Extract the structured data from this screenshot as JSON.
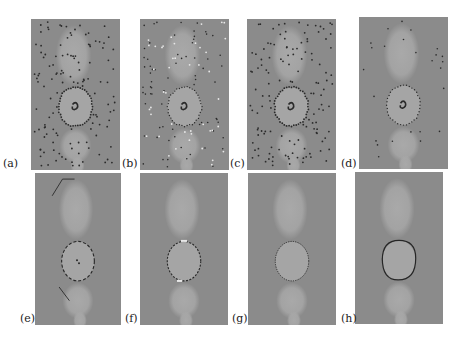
{
  "figure": {
    "panels": [
      {
        "id": "a",
        "label": "(a)",
        "style": "dense-dark-dots",
        "x": 31,
        "y": 19,
        "w": 89,
        "h": 151,
        "label_x": 3,
        "label_y": 158
      },
      {
        "id": "b",
        "label": "(b)",
        "style": "dense-mixed-dots",
        "x": 140,
        "y": 19,
        "w": 89,
        "h": 151,
        "label_x": 122,
        "label_y": 158
      },
      {
        "id": "c",
        "label": "(c)",
        "style": "dense-dark-dots",
        "x": 247,
        "y": 19,
        "w": 89,
        "h": 151,
        "label_x": 230,
        "label_y": 158
      },
      {
        "id": "d",
        "label": "(d)",
        "style": "sparse-dots",
        "x": 359,
        "y": 17,
        "w": 89,
        "h": 152,
        "label_x": 341,
        "label_y": 158
      },
      {
        "id": "e",
        "label": "(e)",
        "style": "segments",
        "x": 35,
        "y": 173,
        "w": 86,
        "h": 152,
        "label_x": 20,
        "label_y": 313
      },
      {
        "id": "f",
        "label": "(f)",
        "style": "contour-with-highlights",
        "x": 140,
        "y": 173,
        "w": 88,
        "h": 152,
        "label_x": 125,
        "label_y": 313
      },
      {
        "id": "g",
        "label": "(g)",
        "style": "dotted-contour",
        "x": 248,
        "y": 173,
        "w": 88,
        "h": 152,
        "label_x": 232,
        "label_y": 313
      },
      {
        "id": "h",
        "label": "(h)",
        "style": "solid-contour",
        "x": 355,
        "y": 172,
        "w": 88,
        "h": 152,
        "label_x": 341,
        "label_y": 313
      }
    ],
    "colors": {
      "background": "#8b8b8b",
      "blob": "#a9a9a9",
      "marker_dark": "#2a2a2a",
      "marker_light": "#e8e8e8",
      "contour": "#262626"
    }
  }
}
